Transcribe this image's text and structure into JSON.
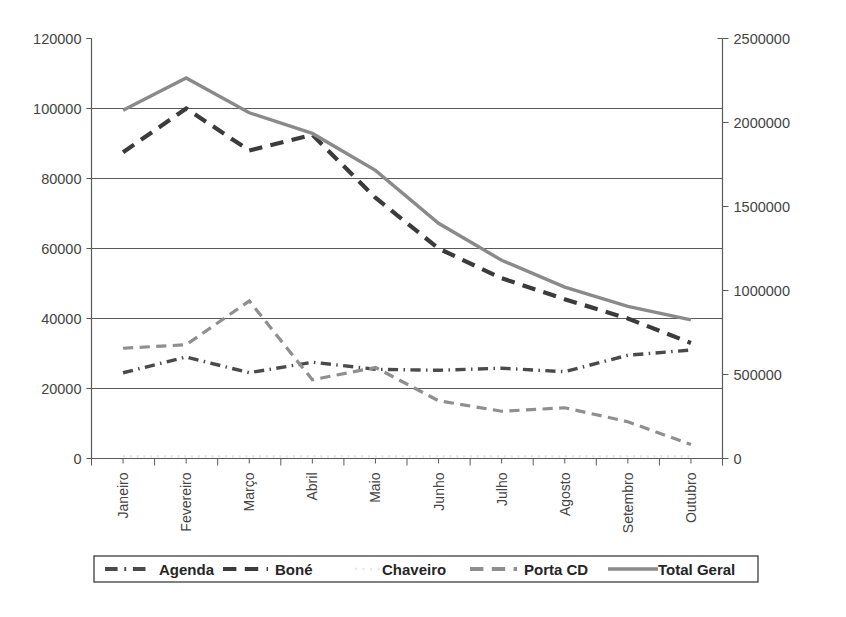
{
  "chart_data": {
    "type": "line",
    "title": "",
    "subtitle": "",
    "xlabel": "",
    "ylabel": "",
    "grid": "horizontal",
    "legend_position": "bottom",
    "categories": [
      "Janeiro",
      "Fevereiro",
      "Março",
      "Abril",
      "Maio",
      "Junho",
      "Julho",
      "Agosto",
      "Setembro",
      "Outubro"
    ],
    "axes": {
      "left": {
        "ticks": [
          "0",
          "20000",
          "40000",
          "60000",
          "80000",
          "100000",
          "120000"
        ],
        "values": [
          0,
          20000,
          40000,
          60000,
          80000,
          100000,
          120000
        ],
        "ylim": [
          0,
          120000
        ],
        "applies_to": [
          "Agenda",
          "Boné",
          "Chaveiro",
          "Porta CD"
        ]
      },
      "right": {
        "ticks": [
          "0",
          "500000",
          "1000000",
          "1500000",
          "2000000",
          "2500000"
        ],
        "values": [
          0,
          500000,
          1000000,
          1500000,
          2000000,
          2500000
        ],
        "ylim": [
          0,
          2500000
        ],
        "applies_to": [
          "Total Geral"
        ]
      }
    },
    "series": [
      {
        "name": "Agenda",
        "axis": "left",
        "color": "#4a4a4a",
        "style": "dash-dot",
        "width": 3.4,
        "values": [
          24500,
          29000,
          24500,
          27500,
          25500,
          25200,
          25800,
          24800,
          29500,
          31000
        ]
      },
      {
        "name": "Boné",
        "axis": "left",
        "color": "#3b3b3b",
        "style": "dashed",
        "width": 4.2,
        "values": [
          87500,
          100000,
          88000,
          92500,
          74500,
          60000,
          51500,
          45500,
          40000,
          33000
        ]
      },
      {
        "name": "Chaveiro",
        "axis": "left",
        "color": "#e2e2e2",
        "style": "dotted",
        "width": 2.2,
        "values": [
          600,
          600,
          600,
          600,
          600,
          600,
          600,
          600,
          600,
          600
        ]
      },
      {
        "name": "Porta CD",
        "axis": "left",
        "color": "#8f8f8f",
        "style": "dashed",
        "width": 3.2,
        "values": [
          31500,
          32500,
          45000,
          22500,
          26000,
          16500,
          13500,
          14500,
          10500,
          4000
        ]
      },
      {
        "name": "Total Geral",
        "axis": "right",
        "color": "#8a8a8a",
        "style": "solid",
        "width": 3.4,
        "values": [
          2073000,
          2265000,
          2058000,
          1935000,
          1715000,
          1400000,
          1180000,
          1020000,
          905000,
          825000
        ]
      }
    ]
  },
  "legend": {
    "items": [
      {
        "label": "Agenda",
        "color": "#4a4a4a",
        "style": "dash-dot"
      },
      {
        "label": "Boné",
        "color": "#3b3b3b",
        "style": "dashed"
      },
      {
        "label": "Chaveiro",
        "color": "#e8e8e8",
        "style": "dotted"
      },
      {
        "label": "Porta CD",
        "color": "#8f8f8f",
        "style": "dashed"
      },
      {
        "label": "Total Geral",
        "color": "#8a8a8a",
        "style": "solid"
      }
    ]
  }
}
